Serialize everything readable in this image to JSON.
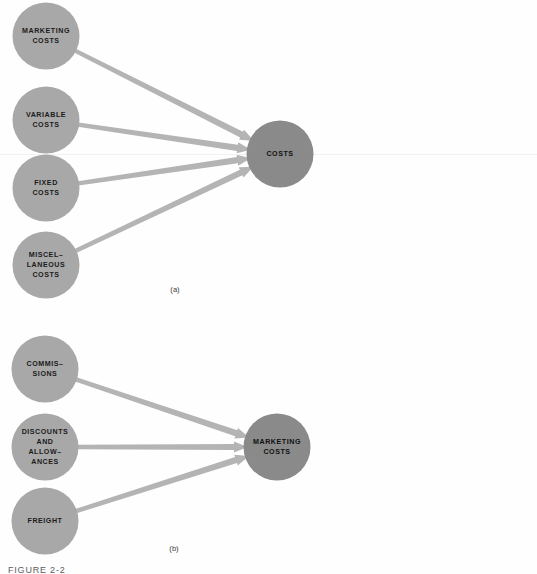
{
  "figure": {
    "caption": "FIGURE 2-2",
    "background_color": "#fefefe",
    "source_node_color": "#a8a8a8",
    "target_node_color": "#8a8a8a",
    "arrow_color": "#b4b4b4",
    "label_color": "#1b1b1b"
  },
  "panels": [
    {
      "id": "panel-a",
      "caption": "(a)",
      "target": {
        "id": "costs",
        "label_lines": [
          "COSTS"
        ],
        "cx": 280,
        "cy": 154,
        "r": 33.5
      },
      "sources": [
        {
          "id": "marketing-costs",
          "label_lines": [
            "MARKETING",
            "COSTS"
          ],
          "cx": 46,
          "cy": 36,
          "r": 33.5
        },
        {
          "id": "variable-costs",
          "label_lines": [
            "VARIABLE",
            "COSTS"
          ],
          "cx": 46,
          "cy": 120,
          "r": 33.5
        },
        {
          "id": "fixed-costs",
          "label_lines": [
            "FIXED",
            "COSTS"
          ],
          "cx": 46,
          "cy": 188,
          "r": 33.5
        },
        {
          "id": "miscellaneous-costs",
          "label_lines": [
            "MISCEL–",
            "LANEOUS",
            "COSTS"
          ],
          "cx": 46,
          "cy": 265,
          "r": 33.5
        }
      ],
      "caption_x": 175,
      "caption_y": 292
    },
    {
      "id": "panel-b",
      "caption": "(b)",
      "target": {
        "id": "marketing-costs-target",
        "label_lines": [
          "MARKETING",
          "COSTS"
        ],
        "cx": 277,
        "cy": 447,
        "r": 33.5
      },
      "sources": [
        {
          "id": "commissions",
          "label_lines": [
            "COMMIS–",
            "SIONS"
          ],
          "cx": 45,
          "cy": 369,
          "r": 33.5
        },
        {
          "id": "discounts-and-allowances",
          "label_lines": [
            "DISCOUNTS",
            "AND",
            "ALLOW–",
            "ANCES"
          ],
          "cx": 45,
          "cy": 447,
          "r": 33.5
        },
        {
          "id": "freight",
          "label_lines": [
            "FREIGHT"
          ],
          "cx": 45,
          "cy": 521,
          "r": 33.5
        }
      ],
      "caption_x": 174,
      "caption_y": 551
    }
  ]
}
